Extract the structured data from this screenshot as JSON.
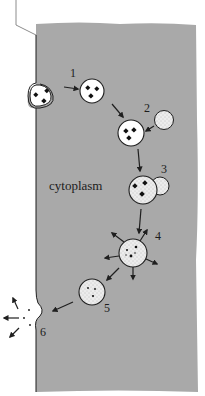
{
  "diagram": {
    "title": "",
    "region_label": "cytoplasm",
    "colors": {
      "cytoplasm": "#a9a9a9",
      "outline": "#1f1f1f",
      "vesicle_fill": "#ffffff",
      "stipple_fill": "#e4e4e4",
      "background": "#ffffff"
    },
    "steps": [
      {
        "id": "1",
        "label": "1",
        "description": "Endocytic vesicle pinched off from membrane, carrying particles"
      },
      {
        "id": "2",
        "label": "2",
        "description": "Lysosome approaches vesicle"
      },
      {
        "id": "3",
        "label": "3",
        "description": "Lysosome fuses with vesicle"
      },
      {
        "id": "4",
        "label": "4",
        "description": "Digestion; products diffuse outward"
      },
      {
        "id": "5",
        "label": "5",
        "description": "Residual body with undigested remains"
      },
      {
        "id": "6",
        "label": "6",
        "description": "Exocytosis of residues out of the cell"
      }
    ]
  }
}
